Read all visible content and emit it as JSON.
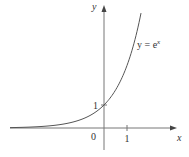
{
  "chart_data": {
    "type": "line",
    "title": "",
    "function": "y = e^x",
    "curve_label": "y = e",
    "curve_label_exponent": "x",
    "xlabel": "x",
    "ylabel": "y",
    "x_ticks": [
      "1"
    ],
    "y_ticks": [
      "1"
    ],
    "origin_label": "0",
    "x": [
      -4,
      -3,
      -2,
      -1,
      0,
      0.5,
      1,
      1.5,
      1.65
    ],
    "values": [
      0.018,
      0.05,
      0.135,
      0.368,
      1,
      1.649,
      2.718,
      4.482,
      5.207
    ],
    "xlim": [
      -4,
      3
    ],
    "ylim": [
      -1,
      5.5
    ],
    "grid": false,
    "colors": {
      "curve": "#555555",
      "axis": "#666666"
    }
  }
}
